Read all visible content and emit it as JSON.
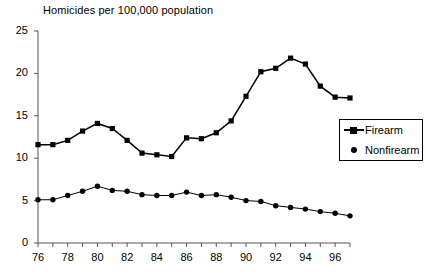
{
  "chart_data": {
    "type": "line",
    "title": "Homicides per 100,000 population",
    "xlabel": "",
    "ylabel": "",
    "xlim": [
      1976,
      1997
    ],
    "ylim": [
      0,
      25
    ],
    "yticks": [
      0,
      5,
      10,
      15,
      20,
      25
    ],
    "ytick_labels": [
      "0",
      "5",
      "10",
      "15",
      "20",
      "25"
    ],
    "x": [
      1976,
      1977,
      1978,
      1979,
      1980,
      1981,
      1982,
      1983,
      1984,
      1985,
      1986,
      1987,
      1988,
      1989,
      1990,
      1991,
      1992,
      1993,
      1994,
      1995,
      1996,
      1997
    ],
    "xtick_labels": [
      "76",
      "",
      "78",
      "",
      "80",
      "",
      "82",
      "",
      "84",
      "",
      "86",
      "",
      "88",
      "",
      "90",
      "",
      "92",
      "",
      "94",
      "",
      "96",
      ""
    ],
    "xtick_labels_shown": [
      "76",
      "78",
      "80",
      "82",
      "84",
      "86",
      "88",
      "90",
      "92",
      "94",
      "96"
    ],
    "grid": false,
    "legend_position": "right-middle",
    "series": [
      {
        "name": "Firearm",
        "marker": "square",
        "color": "#000000",
        "values": [
          11.6,
          11.6,
          12.1,
          13.2,
          14.1,
          13.5,
          12.1,
          10.6,
          10.4,
          10.2,
          12.4,
          12.3,
          13.0,
          14.4,
          17.3,
          20.2,
          20.6,
          21.8,
          21.1,
          18.5,
          17.2,
          17.1
        ]
      },
      {
        "name": "Nonfirearm",
        "marker": "dot",
        "color": "#000000",
        "values": [
          5.1,
          5.1,
          5.6,
          6.1,
          6.7,
          6.2,
          6.1,
          5.7,
          5.6,
          5.6,
          6.0,
          5.6,
          5.7,
          5.4,
          5.0,
          4.9,
          4.4,
          4.2,
          4.0,
          3.7,
          3.5,
          3.2
        ]
      }
    ]
  },
  "legend": {
    "items": [
      {
        "label": "Firearm"
      },
      {
        "label": "Nonfirearm"
      }
    ]
  }
}
